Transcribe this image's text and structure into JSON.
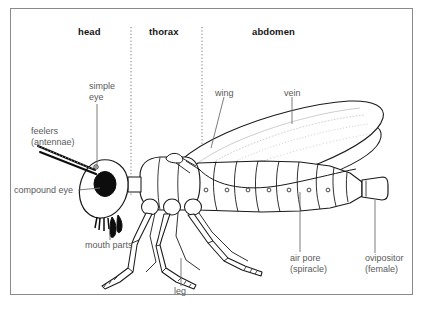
{
  "diagram": {
    "frame_color": "#8a8a8a",
    "label_color": "#5a5a5a",
    "region_label_color": "#151515",
    "line_color": "#1a1a1a",
    "regions": [
      {
        "id": "head",
        "label": "head"
      },
      {
        "id": "thorax",
        "label": "thorax"
      },
      {
        "id": "abdomen",
        "label": "abdomen"
      }
    ],
    "parts": [
      {
        "id": "simple-eye",
        "label": "simple\neye",
        "line1": "simple",
        "line2": "eye"
      },
      {
        "id": "feelers",
        "label": "feelers\n(antennae)",
        "line1": "feelers",
        "line2": "(antennae)"
      },
      {
        "id": "compound-eye",
        "label": "compound eye",
        "line1": "compound eye",
        "line2": ""
      },
      {
        "id": "mouth-parts",
        "label": "mouth parts",
        "line1": "mouth parts",
        "line2": ""
      },
      {
        "id": "leg",
        "label": "leg",
        "line1": "leg",
        "line2": ""
      },
      {
        "id": "wing",
        "label": "wing",
        "line1": "wing",
        "line2": ""
      },
      {
        "id": "vein",
        "label": "vein",
        "line1": "vein",
        "line2": ""
      },
      {
        "id": "air-pore",
        "label": "air pore\n(spiracle)",
        "line1": "air pore",
        "line2": "(spiracle)"
      },
      {
        "id": "ovipositor",
        "label": "ovipositor\n(female)",
        "line1": "ovipositor",
        "line2": "(female)"
      }
    ]
  }
}
